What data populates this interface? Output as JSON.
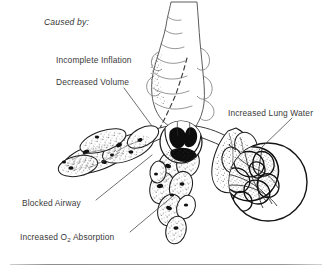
{
  "figure": {
    "title_label": "Caused by:",
    "labels": [
      {
        "id": "caused-by",
        "text": "Caused by:",
        "style": "italic",
        "x": 44,
        "y": 18
      },
      {
        "id": "incomplete-inflation",
        "text": "Incomplete Inflation",
        "style": "plain",
        "x": 56,
        "y": 56
      },
      {
        "id": "decreased-volume",
        "text": "Decreased Volume",
        "style": "plain",
        "x": 56,
        "y": 78
      },
      {
        "id": "increased-lung-water",
        "text": "Increased Lung Water",
        "style": "plain",
        "x": 228,
        "y": 109
      },
      {
        "id": "blocked-airway",
        "text": "Blocked Airway",
        "style": "plain",
        "x": 22,
        "y": 199
      },
      {
        "id": "increased-o2-absorption",
        "text_before": "Increased O",
        "subscript": "2",
        "text_after": " Absorption",
        "style": "plain",
        "x": 20,
        "y": 233
      }
    ],
    "leader_lines": [
      {
        "id": "leader-decreased-volume",
        "from": [
          124,
          88
        ],
        "to": [
          152,
          126
        ]
      },
      {
        "id": "leader-increased-lung-water",
        "from": [
          292,
          118
        ],
        "to": [
          259,
          150
        ]
      },
      {
        "id": "leader-blocked-airway",
        "from": [
          96,
          200
        ],
        "to": [
          152,
          155
        ]
      },
      {
        "id": "leader-increased-o2",
        "from": [
          130,
          232
        ],
        "to": [
          173,
          196
        ]
      }
    ],
    "anatomy": {
      "trachea": "vertical airway at center top",
      "bronchi": "three branching bronchial trees",
      "alveolar_clusters": [
        "left-stippled-cluster",
        "center-cluster",
        "right-cluster"
      ],
      "insets": [
        {
          "id": "inset-blocked-airway",
          "shape": "circle",
          "cx": 181,
          "cy": 142,
          "r": 21,
          "content": "mucus-plug-occluding-bronchiole"
        },
        {
          "id": "inset-increased-lung-water",
          "shape": "circle",
          "cx": 268,
          "cy": 182,
          "r": 39,
          "content": "dense-capillary-network-edema"
        }
      ]
    },
    "colors": {
      "background": "#ffffff",
      "ink": "#1a1a1a",
      "text": "#3a3a3a",
      "rule": "#9a9a9a"
    },
    "footer_rule": true
  }
}
